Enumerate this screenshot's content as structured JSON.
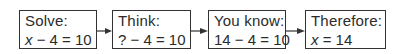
{
  "diagram": {
    "type": "flowchart",
    "direction": "left-to-right",
    "colors": {
      "border": "#333333",
      "text": "#2b2b2b",
      "arrow": "#333333",
      "background": "#ffffff"
    },
    "steps": [
      {
        "label": "Solve:",
        "expression": {
          "var": "x",
          "rest": " − 4 = 10"
        }
      },
      {
        "label": "Think:",
        "expression": {
          "var": "",
          "rest": "? − 4 = 10"
        }
      },
      {
        "label": "You know:",
        "expression": {
          "var": "",
          "rest": "14 − 4 = 10"
        }
      },
      {
        "label": "Therefore:",
        "expression": {
          "var": "x",
          "rest": " = 14"
        }
      }
    ],
    "connectors": [
      {
        "from": 0,
        "to": 1,
        "icon": "arrow-right-icon"
      },
      {
        "from": 1,
        "to": 2,
        "icon": "arrow-right-icon"
      },
      {
        "from": 2,
        "to": 3,
        "icon": "arrow-right-icon"
      }
    ]
  }
}
